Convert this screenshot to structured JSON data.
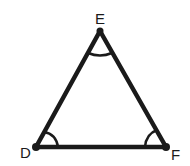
{
  "diagram": {
    "type": "triangle",
    "vertices": [
      {
        "label": "E",
        "x": 100,
        "y": 31,
        "angle_marked": true
      },
      {
        "label": "D",
        "x": 36,
        "y": 147,
        "angle_marked": true
      },
      {
        "label": "F",
        "x": 166,
        "y": 147,
        "angle_marked": true
      }
    ],
    "edges": [
      [
        "D",
        "E"
      ],
      [
        "E",
        "F"
      ],
      [
        "D",
        "F"
      ]
    ],
    "angle_marks": "single arc at each vertex",
    "stroke_color": "#1a1a1a",
    "background": "#ffffff"
  }
}
